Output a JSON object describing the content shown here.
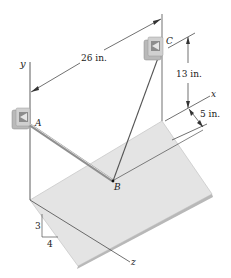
{
  "diagram": {
    "points": {
      "A": "A",
      "B": "B",
      "C": "C"
    },
    "axes": {
      "x": "x",
      "y": "y",
      "z": "z"
    },
    "dimensions": {
      "ac_distance": "26 in.",
      "c_height": "13 in.",
      "x_offset": "5 in."
    },
    "slope": {
      "rise": "3",
      "run": "4"
    },
    "colors": {
      "plane": "#e3e3e3",
      "plane_edge": "#b5b5b5",
      "bracket": "#bdbdbd",
      "rod": "#9a9a9a",
      "line": "#333333"
    }
  }
}
